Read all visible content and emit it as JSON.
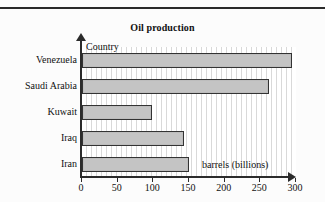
{
  "chart_data": {
    "type": "bar",
    "orientation": "horizontal",
    "title": "Oil production",
    "xlabel": "barrels (billions)",
    "ylabel": "Country",
    "categories": [
      "Venezuela",
      "Saudi Arabia",
      "Kuwait",
      "Iraq",
      "Iran"
    ],
    "values": [
      295,
      262,
      98,
      143,
      150
    ],
    "xticks": [
      0,
      50,
      100,
      150,
      200,
      250,
      300
    ],
    "xticklabels": [
      "0",
      "50",
      "100",
      "150",
      "200",
      "250",
      "300"
    ],
    "xlim": [
      0,
      300
    ],
    "grid": "vertical-stripes",
    "legend": null,
    "bar_fill": "#c4c4c4",
    "bar_edge": "#333333",
    "axis_color": "#2b2b2b",
    "background": "#fcfcfc"
  },
  "layout": {
    "axis_arrow_x_name": "x-axis-arrow",
    "axis_arrow_y_name": "y-axis-arrow"
  }
}
